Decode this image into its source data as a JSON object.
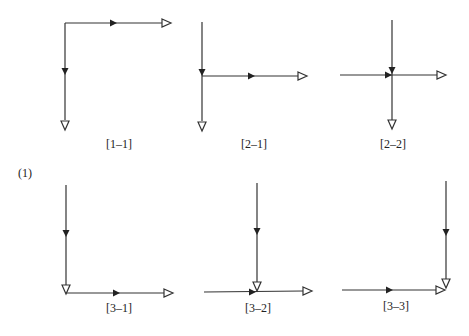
{
  "figure_label": "(1)",
  "colors": {
    "line": "#333333",
    "background": "#ffffff"
  },
  "panels": [
    {
      "id": "1-1",
      "label": "[1–1]",
      "description": "L-shape: corner at top-left; horizontal arrow right, vertical arrow down"
    },
    {
      "id": "2-1",
      "label": "[2–1]",
      "description": "Vertical line from top meets horizontal at junction; continues down; horizontal arrow right"
    },
    {
      "id": "2-2",
      "label": "[2–2]",
      "description": "Cross: horizontal from left and vertical from top meet at center; continue right and down"
    },
    {
      "id": "3-1",
      "label": "[3–1]",
      "description": "Vertical arrow down ends at corner; horizontal arrow right from corner"
    },
    {
      "id": "3-2",
      "label": "[3–2]",
      "description": "Horizontal from left continues right; vertical from top ends at junction"
    },
    {
      "id": "3-3",
      "label": "[3–3]",
      "description": "Horizontal from left and vertical from top both end at bottom-right corner"
    }
  ],
  "legend": {
    "filled_arrow": "flow direction (filled arrowhead)",
    "hollow_arrow": "endpoint (hollow arrowhead)"
  }
}
